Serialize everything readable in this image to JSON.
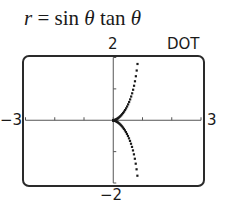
{
  "title": {
    "lhs": "r",
    "eq": " = sin ",
    "theta1": "θ",
    "mid": " tan ",
    "theta2": "θ"
  },
  "mode_label": "DOT",
  "axis_labels": {
    "ymax": "2",
    "ymin": "−2",
    "xmin": "−3",
    "xmax": "3"
  },
  "chart_data": {
    "type": "scatter",
    "title": "r = sin θ tan θ",
    "mode": "DOT",
    "equation": "r = sin(θ)·tan(θ)",
    "parametric": {
      "x": "sin²θ",
      "y": "sin²θ·tanθ"
    },
    "xlim": [
      -3,
      3
    ],
    "ylim": [
      -2,
      2
    ],
    "xticks": [
      -3,
      -2,
      -1,
      0,
      1,
      2,
      3
    ],
    "yticks": [
      -2,
      -1,
      0,
      1,
      2
    ],
    "tick_labels": {
      "x": [
        "−3",
        "3"
      ],
      "y": [
        "−2",
        "2"
      ]
    },
    "grid": false,
    "legend": null,
    "sample_points": [
      {
        "x": 0.0,
        "y": 0.0
      },
      {
        "x": 0.1,
        "y": 0.033
      },
      {
        "x": 0.2,
        "y": 0.1
      },
      {
        "x": 0.3,
        "y": 0.196
      },
      {
        "x": 0.4,
        "y": 0.327
      },
      {
        "x": 0.5,
        "y": 0.5
      },
      {
        "x": 0.6,
        "y": 0.735
      },
      {
        "x": 0.7,
        "y": 1.069
      },
      {
        "x": 0.75,
        "y": 1.299
      },
      {
        "x": 0.8,
        "y": 1.6
      },
      {
        "x": 0.84,
        "y": 1.93
      },
      {
        "x": 0.1,
        "y": -0.033
      },
      {
        "x": 0.3,
        "y": -0.196
      },
      {
        "x": 0.5,
        "y": -0.5
      },
      {
        "x": 0.7,
        "y": -1.069
      },
      {
        "x": 0.8,
        "y": -1.6
      },
      {
        "x": 0.84,
        "y": -1.93
      }
    ]
  },
  "colors": {
    "frame": "#2a2a2a",
    "axis": "#555555",
    "dots": "#1a1a1a"
  }
}
